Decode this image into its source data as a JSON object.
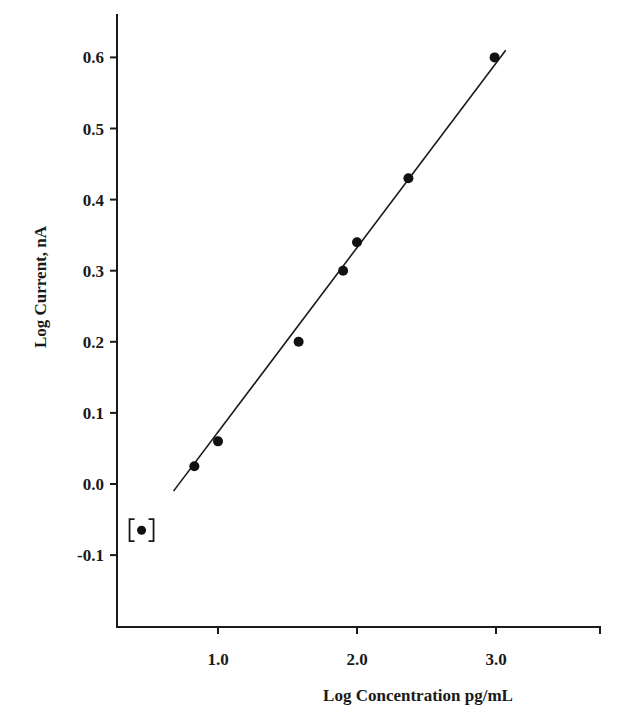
{
  "chart_data": {
    "type": "scatter",
    "title": "",
    "xlabel": "Log Concentration pg/mL",
    "ylabel": "Log Current, nA",
    "xlim": [
      0.3,
      3.75
    ],
    "ylim": [
      -0.2,
      0.66
    ],
    "x_ticks": [
      1.0,
      2.0,
      3.0
    ],
    "x_tick_labels": [
      "1.0",
      "2.0",
      "3.0"
    ],
    "y_ticks": [
      0.6,
      0.5,
      0.4,
      0.3,
      0.2,
      0.1,
      0.0,
      -0.1
    ],
    "y_tick_labels": [
      "0.6",
      "0.5",
      "0.4",
      "0.3",
      "0.2",
      "0.1",
      "0.0",
      "-0.1"
    ],
    "grid": false,
    "legend": null,
    "series": [
      {
        "name": "Data points",
        "marker": "filled-circle",
        "x": [
          0.83,
          1.0,
          1.58,
          1.9,
          2.0,
          2.37,
          2.99
        ],
        "y": [
          0.025,
          0.06,
          0.2,
          0.3,
          0.34,
          0.43,
          0.6
        ]
      },
      {
        "name": "Excluded point (bracketed)",
        "marker": "bracketed-filled-circle",
        "x": [
          0.45
        ],
        "y": [
          -0.065
        ]
      },
      {
        "name": "Linear fit",
        "type": "line",
        "x": [
          0.68,
          3.07
        ],
        "y": [
          -0.01,
          0.61
        ]
      }
    ],
    "colors": {
      "axis": "#1a1a1a",
      "marker": "#111111",
      "line": "#1a1a1a",
      "background": "#ffffff"
    }
  }
}
